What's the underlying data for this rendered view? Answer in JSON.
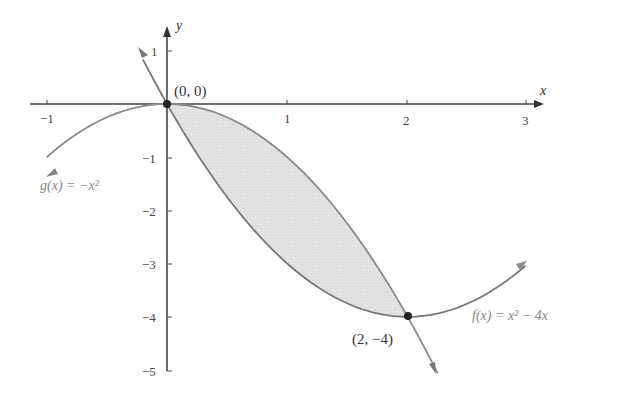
{
  "chart_data": {
    "type": "line",
    "title": "",
    "xlabel": "x",
    "ylabel": "y",
    "xlim": [
      -1.1,
      3.1
    ],
    "ylim": [
      -5,
      1.2
    ],
    "grid": false,
    "x_ticks": [
      -1,
      1,
      2,
      3
    ],
    "y_ticks": [
      1,
      -1,
      -2,
      -3,
      -4,
      -5
    ],
    "x_tick_labels": [
      "-1",
      "1",
      "2",
      "3"
    ],
    "y_tick_labels": [
      "1",
      "-1",
      "-2",
      "-3",
      "-4",
      "-5"
    ],
    "series": [
      {
        "name": "f(x) = x² − 4x",
        "expression": "x^2 - 4x",
        "x": [
          -0.2,
          0,
          0.5,
          1,
          1.5,
          2,
          2.5,
          3
        ],
        "values": [
          0.84,
          0,
          -1.75,
          -3,
          -3.75,
          -4,
          -3.75,
          -3
        ]
      },
      {
        "name": "g(x) = −x²",
        "expression": "-x^2",
        "x": [
          -1,
          -0.5,
          0,
          0.5,
          1,
          1.5,
          2,
          2.25
        ],
        "values": [
          -1,
          -0.25,
          0,
          -0.25,
          -1,
          -2.25,
          -4,
          -5.06
        ]
      }
    ],
    "shaded_region": {
      "between": [
        "g(x)",
        "f(x)"
      ],
      "x_from": 0,
      "x_to": 2
    },
    "annotations": [
      {
        "text": "(0, 0)",
        "x": 0,
        "y": 0
      },
      {
        "text": "(2, −4)",
        "x": 2,
        "y": -4
      },
      {
        "text": "g(x) = −x²",
        "near_x": -1,
        "near_y": -1.3
      },
      {
        "text": "f(x) = x² − 4x",
        "near_x": 2.6,
        "near_y": -4
      }
    ]
  },
  "labels": {
    "x_axis": "x",
    "y_axis": "y",
    "origin": "(0, 0)",
    "intersection": "(2, −4)",
    "g_label": "g(x) = −x²",
    "f_label": "f(x) = x² − 4x",
    "x_ticks": [
      "−1",
      "1",
      "2",
      "3"
    ],
    "y_ticks": [
      "1",
      "−1",
      "−2",
      "−3",
      "−4",
      "−5"
    ]
  }
}
